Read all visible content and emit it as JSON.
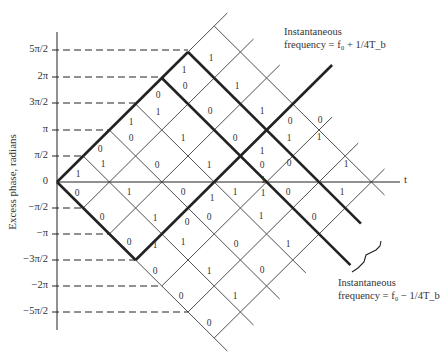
{
  "axis": {
    "y_title": "Excess phase, radians",
    "x_label": "t",
    "y_ticks": [
      {
        "label": "5π/2",
        "y": 50
      },
      {
        "label": "2π",
        "y": 77
      },
      {
        "label": "3π/2",
        "y": 103
      },
      {
        "label": "π",
        "y": 130
      },
      {
        "label": "π/2",
        "y": 156
      },
      {
        "label": "0",
        "y": 182
      },
      {
        "label": "−π/2",
        "y": 208
      },
      {
        "label": "−π",
        "y": 234
      },
      {
        "label": "−3π/2",
        "y": 260
      },
      {
        "label": "−2π",
        "y": 286
      },
      {
        "label": "−5π/2",
        "y": 312
      }
    ]
  },
  "annotations": {
    "upper_line1": "Instantaneous",
    "upper_line2": "frequency = f₀ + 1/4T_b",
    "lower_line1": "Instantaneous",
    "lower_line2": "frequency = f₀ − 1/4T_b"
  },
  "bits": [
    {
      "t": "1",
      "x": 211,
      "y": 58
    },
    {
      "t": "1",
      "x": 184,
      "y": 70
    },
    {
      "t": "0",
      "x": 185,
      "y": 86
    },
    {
      "t": "1",
      "x": 237,
      "y": 86
    },
    {
      "t": "0",
      "x": 158,
      "y": 95
    },
    {
      "t": "1",
      "x": 158,
      "y": 112
    },
    {
      "t": "0",
      "x": 210,
      "y": 111
    },
    {
      "t": "1",
      "x": 262,
      "y": 111
    },
    {
      "t": "1",
      "x": 131,
      "y": 122
    },
    {
      "t": "0",
      "x": 131,
      "y": 138
    },
    {
      "t": "1",
      "x": 183,
      "y": 138
    },
    {
      "t": "0",
      "x": 235,
      "y": 138
    },
    {
      "t": "1",
      "x": 289,
      "y": 138
    },
    {
      "t": "0",
      "x": 290,
      "y": 121
    },
    {
      "t": "0",
      "x": 320,
      "y": 120
    },
    {
      "t": "1",
      "x": 319,
      "y": 137
    },
    {
      "t": "0",
      "x": 100,
      "y": 149
    },
    {
      "t": "1",
      "x": 103,
      "y": 164
    },
    {
      "t": "0",
      "x": 157,
      "y": 165
    },
    {
      "t": "1",
      "x": 209,
      "y": 165
    },
    {
      "t": "1",
      "x": 262,
      "y": 151
    },
    {
      "t": "0",
      "x": 262,
      "y": 165
    },
    {
      "t": "1",
      "x": 346,
      "y": 164
    },
    {
      "t": "1",
      "x": 78,
      "y": 174
    },
    {
      "t": "1",
      "x": 263,
      "y": 180
    },
    {
      "t": "0",
      "x": 289,
      "y": 163
    },
    {
      "t": "0",
      "x": 77,
      "y": 193
    },
    {
      "t": "1",
      "x": 129,
      "y": 192
    },
    {
      "t": "0",
      "x": 183,
      "y": 192
    },
    {
      "t": "1",
      "x": 212,
      "y": 198
    },
    {
      "t": "1",
      "x": 235,
      "y": 192
    },
    {
      "t": "0",
      "x": 288,
      "y": 192
    },
    {
      "t": "1",
      "x": 342,
      "y": 192
    },
    {
      "t": "1",
      "x": 263,
      "y": 193
    },
    {
      "t": "0",
      "x": 102,
      "y": 217
    },
    {
      "t": "1",
      "x": 155,
      "y": 218
    },
    {
      "t": "0",
      "x": 187,
      "y": 222
    },
    {
      "t": "0",
      "x": 209,
      "y": 217
    },
    {
      "t": "1",
      "x": 261,
      "y": 216
    },
    {
      "t": "0",
      "x": 314,
      "y": 217
    },
    {
      "t": "0",
      "x": 129,
      "y": 242
    },
    {
      "t": "1",
      "x": 155,
      "y": 245
    },
    {
      "t": "1",
      "x": 183,
      "y": 242
    },
    {
      "t": "0",
      "x": 236,
      "y": 244
    },
    {
      "t": "1",
      "x": 288,
      "y": 244
    },
    {
      "t": "0",
      "x": 155,
      "y": 271
    },
    {
      "t": "1",
      "x": 209,
      "y": 271
    },
    {
      "t": "0",
      "x": 262,
      "y": 270
    },
    {
      "t": "0",
      "x": 181,
      "y": 296
    },
    {
      "t": "1",
      "x": 235,
      "y": 296
    },
    {
      "t": "0",
      "x": 209,
      "y": 323
    }
  ]
}
